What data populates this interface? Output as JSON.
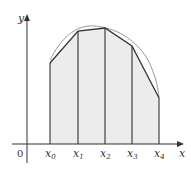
{
  "diagram": {
    "axes": {
      "x_label": "x",
      "y_label": "y",
      "origin_label": "0"
    },
    "points": [
      {
        "label": "x",
        "sub": "0"
      },
      {
        "label": "x",
        "sub": "1"
      },
      {
        "label": "x",
        "sub": "2"
      },
      {
        "label": "x",
        "sub": "3"
      },
      {
        "label": "x",
        "sub": "4"
      }
    ],
    "colors": {
      "fill": "#ececec",
      "stroke": "#333333",
      "curve": "#888888"
    }
  }
}
